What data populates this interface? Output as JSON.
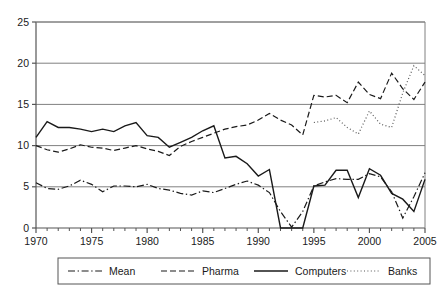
{
  "chart_data": {
    "type": "line",
    "title": "",
    "subtitle": "",
    "xlabel": "",
    "ylabel": "",
    "xlim": [
      1970,
      2005
    ],
    "ylim": [
      0,
      25
    ],
    "yticks": [
      0,
      5,
      10,
      15,
      20,
      25
    ],
    "ytick_labels": [
      "0",
      "5",
      "10",
      "15",
      "20",
      "25"
    ],
    "xticks": [
      1970,
      1975,
      1980,
      1985,
      1990,
      1995,
      2000,
      2005
    ],
    "xtick_labels": [
      "1970",
      "1975",
      "1980",
      "1985",
      "1990",
      "1995",
      "2000",
      "2005"
    ],
    "x_minor_tick_interval": 1,
    "grid": "horizontal",
    "grid_color": "#808080",
    "legend_position": "bottom",
    "legend_border": true,
    "x": [
      1970,
      1971,
      1972,
      1973,
      1974,
      1975,
      1976,
      1977,
      1978,
      1979,
      1980,
      1981,
      1982,
      1983,
      1984,
      1985,
      1986,
      1987,
      1988,
      1989,
      1990,
      1991,
      1992,
      1993,
      1994,
      1995,
      1996,
      1997,
      1998,
      1999,
      2000,
      2001,
      2002,
      2003,
      2004,
      2005
    ],
    "series": [
      {
        "name": "Mean",
        "style": "dashdot",
        "color": "#1a1a1a",
        "width": 1.2,
        "values": [
          5.5,
          4.8,
          4.7,
          5.1,
          5.8,
          5.3,
          4.4,
          5.1,
          5.1,
          5.0,
          5.3,
          4.8,
          4.6,
          4.2,
          4.0,
          4.5,
          4.3,
          4.8,
          5.3,
          5.7,
          5.2,
          4.3,
          2.0,
          0.1,
          2.0,
          5.1,
          5.6,
          6.0,
          5.9,
          5.9,
          6.6,
          6.2,
          4.4,
          1.2,
          3.8,
          6.7
        ]
      },
      {
        "name": "Pharma",
        "style": "dashed",
        "color": "#1a1a1a",
        "width": 1.2,
        "values": [
          10.0,
          9.5,
          9.2,
          9.6,
          10.1,
          9.8,
          9.7,
          9.4,
          9.7,
          10.0,
          9.6,
          9.3,
          8.8,
          9.9,
          10.5,
          11.0,
          11.5,
          12.0,
          12.3,
          12.5,
          13.1,
          13.9,
          13.1,
          12.5,
          11.3,
          16.1,
          15.9,
          16.1,
          15.2,
          17.7,
          16.2,
          15.7,
          18.8,
          16.9,
          15.6,
          17.7
        ]
      },
      {
        "name": "Computers",
        "style": "solid",
        "color": "#1a1a1a",
        "width": 1.4,
        "values": [
          11.0,
          12.9,
          12.2,
          12.2,
          12.0,
          11.7,
          12.0,
          11.7,
          12.4,
          12.8,
          11.2,
          11.0,
          9.8,
          10.4,
          11.0,
          11.8,
          12.4,
          8.5,
          8.7,
          7.8,
          6.3,
          7.1,
          0.0,
          0.0,
          0.0,
          5.1,
          5.2,
          7.0,
          7.0,
          3.7,
          7.2,
          6.4,
          4.2,
          3.5,
          2.0,
          5.9
        ]
      },
      {
        "name": "Banks",
        "style": "dotted",
        "color": "#555555",
        "width": 1.2,
        "start_year": 1995,
        "values": [
          null,
          null,
          null,
          null,
          null,
          null,
          null,
          null,
          null,
          null,
          null,
          null,
          null,
          null,
          null,
          null,
          null,
          null,
          null,
          null,
          null,
          null,
          null,
          null,
          null,
          12.8,
          13.0,
          13.4,
          12.2,
          11.4,
          14.2,
          12.6,
          12.2,
          16.4,
          19.7,
          18.5
        ]
      }
    ]
  },
  "legend": {
    "items": [
      {
        "label": "Mean",
        "style": "dashdot"
      },
      {
        "label": "Pharma",
        "style": "dashed"
      },
      {
        "label": "Computers",
        "style": "solid"
      },
      {
        "label": "Banks",
        "style": "dotted"
      }
    ]
  }
}
